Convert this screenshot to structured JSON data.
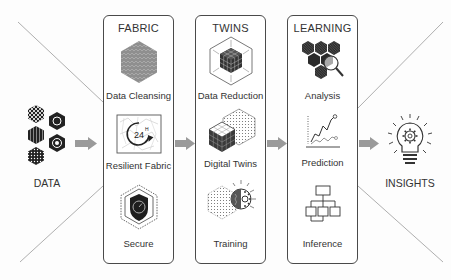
{
  "diagram": {
    "input": {
      "label": "DATA",
      "icon": "hex-data-cluster-icon"
    },
    "output": {
      "label": "INSIGHTS",
      "icon": "lightbulb-gear-icon"
    },
    "stages": [
      {
        "title": "FABRIC",
        "items": [
          {
            "label": "Data Cleansing",
            "icon": "hex-pattern-icon"
          },
          {
            "label": "Resilient Fabric",
            "icon": "24h-clock-network-icon"
          },
          {
            "label": "Secure",
            "icon": "shield-gauge-icon"
          }
        ]
      },
      {
        "title": "TWINS",
        "items": [
          {
            "label": "Data Reduction",
            "icon": "cube-compress-icon"
          },
          {
            "label": "Digital Twins",
            "icon": "cube-twin-icon"
          },
          {
            "label": "Training",
            "icon": "brain-gear-icon"
          }
        ]
      },
      {
        "title": "LEARNING",
        "items": [
          {
            "label": "Analysis",
            "icon": "hex-magnifier-icon"
          },
          {
            "label": "Prediction",
            "icon": "line-chart-icon"
          },
          {
            "label": "Inference",
            "icon": "hierarchy-tree-icon"
          }
        ]
      }
    ],
    "colors": {
      "line": "#4a4a4a",
      "arrow": "#9a9a9a",
      "icon_dark": "#2b2b2b",
      "icon_gray": "#8c8c8c",
      "background": "#fdfdfd"
    }
  }
}
